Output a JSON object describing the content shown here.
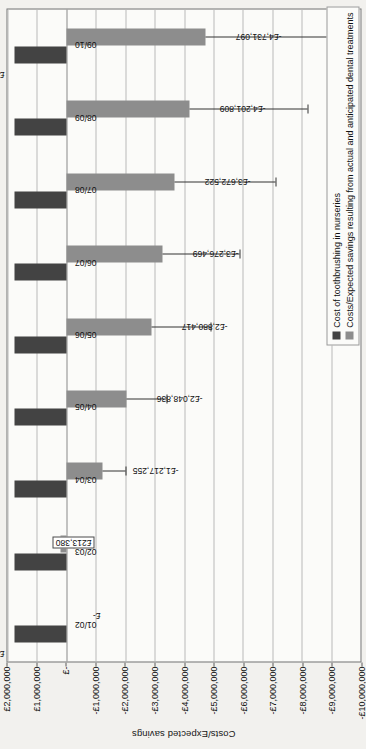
{
  "chart_data": {
    "type": "bar",
    "title": "",
    "xlabel": "",
    "ylabel": "Costs/Expected savings",
    "orientation": "vertical-bars-on-rotated-page",
    "grid": true,
    "legend_position": "bottom-right",
    "ylim": [
      -10000000,
      2000000
    ],
    "categories": [
      "01/02",
      "02/03",
      "03/04",
      "04/05",
      "05/06",
      "06/07",
      "07/08",
      "08/09",
      "09/10"
    ],
    "ytick_labels": [
      "£2,000,000",
      "£1,000,000",
      "£-",
      "-£1,000,000",
      "-£2,000,000",
      "-£3,000,000",
      "-£4,000,000",
      "-£5,000,000",
      "-£6,000,000",
      "-£7,000,000",
      "-£8,000,000",
      "-£9,000,000",
      "-£10,000,000"
    ],
    "ytick_values": [
      2000000,
      1000000,
      0,
      -1000000,
      -2000000,
      -3000000,
      -4000000,
      -5000000,
      -6000000,
      -7000000,
      -8000000,
      -9000000,
      -10000000
    ],
    "series": [
      {
        "name": "Cost of toothbrushing in nurseries",
        "color": "#434343",
        "values": [
          1762621,
          1762621,
          1762621,
          1762621,
          1762621,
          1762621,
          1762621,
          1762621,
          1762621
        ],
        "labels": [
          "£1,762,621",
          "",
          "",
          "",
          "",
          "",
          "",
          "",
          "£1,762,621"
        ]
      },
      {
        "name": "Costs/Expected savings resulting from actual and anticipated dental treatments",
        "color": "#8d8d8d",
        "values": [
          0,
          213380,
          -1217255,
          -2048836,
          -2880417,
          -3276469,
          -3672522,
          -4201809,
          -4731097
        ],
        "labels": [
          "£-",
          "£213,380",
          "-£1,217,255",
          "-£2,048,836",
          "-£2,880,417",
          "-£3,276,469",
          "-£3,672,522",
          "-£4,201,809",
          "-£4,731,097"
        ],
        "error_low": [
          0,
          -250000,
          -2000000,
          -3400000,
          -4900000,
          -5900000,
          -7100000,
          -8200000,
          -9400000
        ]
      }
    ],
    "legend": [
      {
        "label": "Cost of toothbrushing in nurseries",
        "color": "#434343"
      },
      {
        "label": "Costs/Expected savings resulting from actual and anticipated dental treatments",
        "color": "#8d8d8d"
      }
    ]
  }
}
